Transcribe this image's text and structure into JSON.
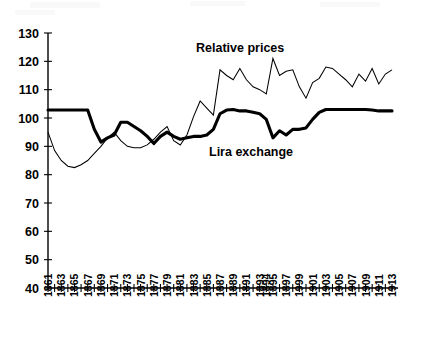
{
  "chart_data": {
    "type": "line",
    "title": "",
    "subtitle": "",
    "xlabel": "",
    "ylabel": "",
    "ylim": [
      40,
      130
    ],
    "ytick_step": 10,
    "ytick_labels": [
      "130",
      "120",
      "110",
      "100",
      "90",
      "80",
      "70",
      "60",
      "50",
      "40"
    ],
    "ytick_values": [
      130,
      120,
      110,
      100,
      90,
      80,
      70,
      60,
      50,
      40
    ],
    "grid": false,
    "legend": "inline-annotations",
    "legend_position": "inline",
    "x": [
      1861,
      1862,
      1863,
      1864,
      1865,
      1866,
      1867,
      1868,
      1869,
      1870,
      1871,
      1872,
      1873,
      1874,
      1875,
      1876,
      1877,
      1878,
      1879,
      1880,
      1881,
      1882,
      1883,
      1884,
      1885,
      1886,
      1887,
      1888,
      1889,
      1890,
      1891,
      1892,
      1893,
      1894,
      1895,
      1896,
      1897,
      1898,
      1899,
      1900,
      1901,
      1902,
      1903,
      1904,
      1905,
      1906,
      1907,
      1908,
      1909,
      1910,
      1911,
      1912,
      1913
    ],
    "xtick_labels": [
      "1861",
      "",
      "1863",
      "",
      "1865",
      "",
      "1867",
      "",
      "1869",
      "",
      "1871",
      "",
      "1873",
      "",
      "1875",
      "",
      "1877",
      "",
      "1879",
      "",
      "1881",
      "",
      "1883",
      "",
      "1885",
      "",
      "1887",
      "",
      "1889",
      "",
      "1891",
      "",
      "1893",
      "1894",
      "1895",
      "",
      "1897",
      "",
      "1999",
      "",
      "1901",
      "",
      "1903",
      "",
      "1905",
      "",
      "1907",
      "",
      "1909",
      "",
      "1911",
      "",
      "1913"
    ],
    "xtick_labels_visible": [
      "1861",
      "1863",
      "1865",
      "1867",
      "1869",
      "1871",
      "1873",
      "1875",
      "1877",
      "1879",
      "1881",
      "1883",
      "1885",
      "1887",
      "1889",
      "1891",
      "1893",
      "1894",
      "1895",
      "1897",
      "1999",
      "1901",
      "1903",
      "1905",
      "1907",
      "1909",
      "1911",
      "1913"
    ],
    "xtick_label_rotation": -90,
    "series": [
      {
        "name": "Relative prices",
        "style": "thin",
        "values": [
          95.0,
          88.5,
          85.0,
          83.0,
          82.5,
          83.5,
          85.0,
          87.5,
          90.0,
          93.0,
          95.0,
          92.0,
          90.0,
          89.5,
          89.5,
          90.5,
          92.5,
          95.0,
          97.0,
          92.0,
          90.5,
          94.0,
          100.5,
          106.0,
          103.5,
          101.0,
          117.0,
          115.0,
          113.5,
          117.5,
          113.5,
          111.0,
          110.0,
          108.5,
          121.0,
          115.0,
          116.5,
          117.0,
          111.0,
          107.0,
          112.5,
          114.0,
          118.0,
          117.5,
          115.5,
          113.5,
          111.0,
          115.5,
          113.0,
          117.5,
          112.0,
          115.5,
          117.0
        ]
      },
      {
        "name": "Lira exchange",
        "style": "thick",
        "values": [
          102.8,
          102.8,
          102.8,
          102.8,
          102.8,
          102.8,
          102.8,
          96.0,
          91.5,
          93.0,
          94.0,
          98.5,
          98.5,
          97.0,
          95.5,
          93.5,
          91.0,
          93.5,
          95.0,
          93.5,
          92.5,
          93.0,
          93.5,
          93.5,
          94.0,
          96.0,
          101.5,
          102.8,
          103.0,
          102.5,
          102.5,
          102.0,
          101.5,
          99.5,
          93.0,
          95.5,
          94.0,
          96.0,
          96.0,
          96.5,
          99.5,
          102.0,
          103.0,
          103.0,
          103.0,
          103.0,
          103.0,
          103.0,
          103.0,
          102.8,
          102.5,
          102.5,
          102.5
        ]
      }
    ],
    "annotations": [
      {
        "text": "Relative prices",
        "x_px": 196,
        "y_px": 52
      },
      {
        "text": "Lira exchange",
        "x_px": 209,
        "y_px": 156
      }
    ]
  },
  "layout": {
    "plot_left_px": 48,
    "plot_right_px": 392,
    "plot_top_px": 33,
    "plot_bottom_px": 288
  }
}
